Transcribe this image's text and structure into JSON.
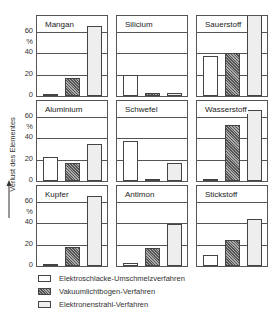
{
  "chart_data": {
    "type": "bar",
    "title": "",
    "ylabel": "Verlust des Elementes",
    "yunit": "%",
    "ylim": [
      0,
      70
    ],
    "yticks": [
      0,
      20,
      40,
      60
    ],
    "grid": true,
    "legend_position": "bottom",
    "series_names": [
      "Elektroschlacke-Umschmelzverfahren",
      "Vakuumlichtbogen-Verfahren",
      "Elektronenstrahl-Verfahren"
    ],
    "panels": [
      {
        "element": "Mangan",
        "values": [
          1,
          17,
          65
        ]
      },
      {
        "element": "Silicium",
        "values": [
          20,
          3,
          3
        ]
      },
      {
        "element": "Sauerstoff",
        "values": [
          37,
          40,
          85
        ]
      },
      {
        "element": "Aluminium",
        "values": [
          22,
          17,
          35
        ]
      },
      {
        "element": "Schwefel",
        "values": [
          37,
          1,
          17
        ]
      },
      {
        "element": "Wasserstoff",
        "values": [
          0.5,
          52,
          66
        ]
      },
      {
        "element": "Kupfer",
        "values": [
          1,
          18,
          65
        ]
      },
      {
        "element": "Antimon",
        "values": [
          3,
          17,
          39
        ]
      },
      {
        "element": "Stickstoff",
        "values": [
          10,
          24,
          44
        ]
      }
    ]
  },
  "axis": {
    "ylabel": "Verlust des Elementes",
    "unit": "%",
    "ticks": [
      "60",
      "40",
      "20",
      "0"
    ]
  },
  "panels": {
    "p0": {
      "title": "Mangan"
    },
    "p1": {
      "title": "Silicium"
    },
    "p2": {
      "title": "Sauerstoff"
    },
    "p3": {
      "title": "Aluminium"
    },
    "p4": {
      "title": "Schwefel"
    },
    "p5": {
      "title": "Wasserstoff"
    },
    "p6": {
      "title": "Kupfer"
    },
    "p7": {
      "title": "Antimon"
    },
    "p8": {
      "title": "Stickstoff"
    }
  },
  "legend": {
    "items": [
      {
        "label": "Elektroschlacke-Umschmelzverfahren"
      },
      {
        "label": "Vakuumlichtbogen-Verfahren"
      },
      {
        "label": "Elektronenstrahl-Verfahren"
      }
    ]
  }
}
